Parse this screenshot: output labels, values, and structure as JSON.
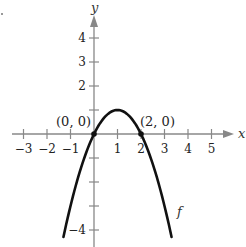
{
  "chart_data": {
    "type": "line",
    "title": "",
    "xlabel": "x",
    "ylabel": "y",
    "xlim": [
      -3.5,
      5.9
    ],
    "ylim": [
      -4.5,
      5.2
    ],
    "grid": false,
    "x_ticks": [
      -3,
      -2,
      -1,
      1,
      2,
      3,
      4,
      5
    ],
    "x_tick_labels": [
      "−3",
      "−2",
      "−1",
      "1",
      "2",
      "3",
      "4",
      "5"
    ],
    "y_ticks": [
      4,
      3,
      2,
      1,
      -1,
      -2,
      -3,
      -4
    ],
    "y_tick_labels": [
      "4",
      "3",
      "2",
      "",
      "",
      "",
      "",
      "−4"
    ],
    "series": [
      {
        "name": "f",
        "equation": "f(x) = -x^2 + 2x",
        "x": [
          -1.3,
          -1,
          -0.5,
          0,
          0.5,
          1,
          1.5,
          2,
          2.5,
          3,
          3.3
        ],
        "y": [
          -4.29,
          -3,
          -1.25,
          0,
          0.75,
          1,
          0.75,
          0,
          -1.25,
          -3,
          -4.29
        ],
        "color": "#111111"
      }
    ],
    "annotations": [
      {
        "label": "(0, 0)",
        "x": 0,
        "y": 0
      },
      {
        "label": "(2, 0)",
        "x": 2,
        "y": 0
      },
      {
        "label": "f",
        "x": 3.3,
        "y": -3.8
      }
    ]
  }
}
